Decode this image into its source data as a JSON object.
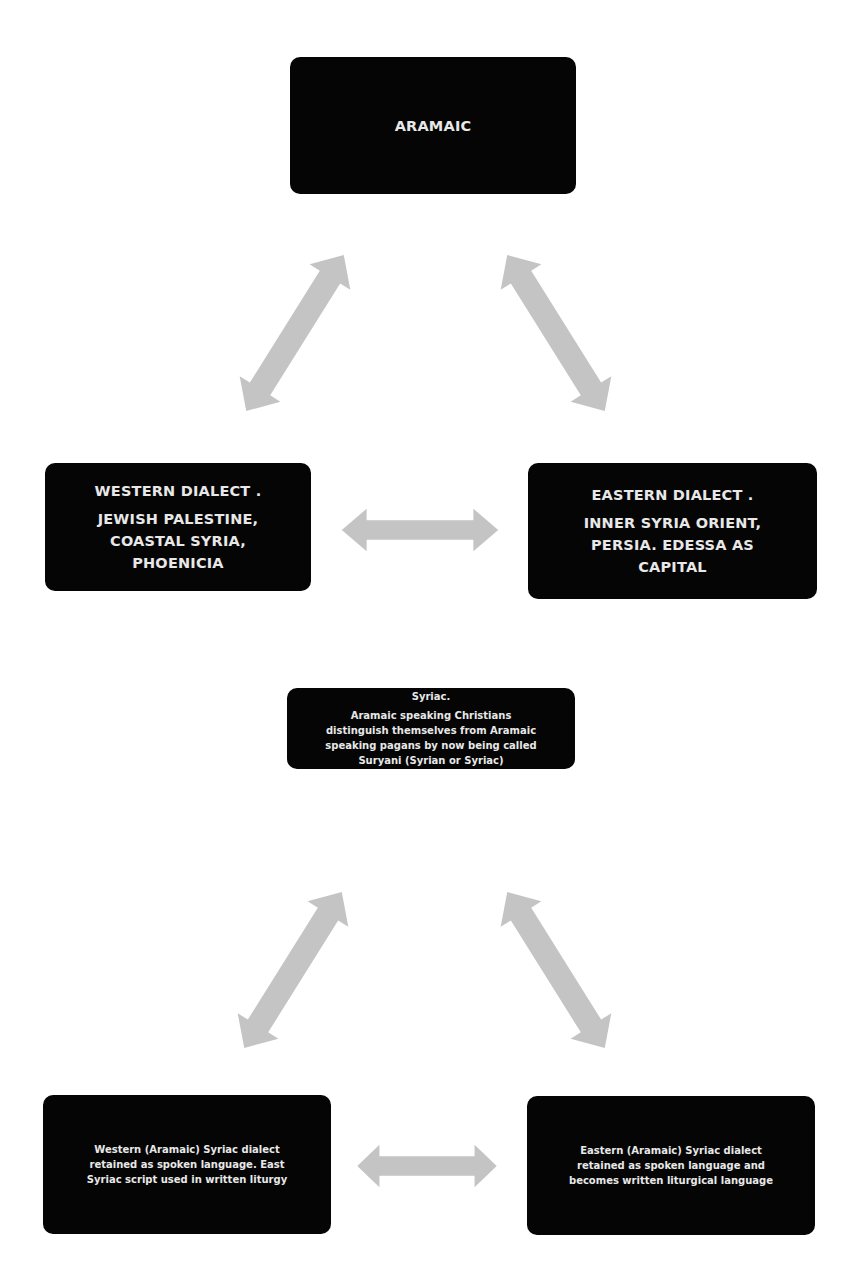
{
  "diagram": {
    "type": "flow-diagram",
    "colors": {
      "box_fill": "#050505",
      "box_text": "#e8e8e8",
      "arrow_fill": "#c4c4c4",
      "background": "#ffffff"
    },
    "nodes": {
      "aramaic": {
        "lines": [
          "ARAMAIC"
        ]
      },
      "western_dialect": {
        "heading": "WESTERN DIALECT .",
        "lines": [
          "JEWISH PALESTINE,",
          "COASTAL SYRIA,",
          "PHOENICIA"
        ]
      },
      "eastern_dialect": {
        "heading": "EASTERN DIALECT .",
        "lines": [
          "INNER SYRIA ORIENT,",
          "PERSIA. EDESSA AS",
          "CAPITAL"
        ]
      },
      "syriac": {
        "heading": "Syriac.",
        "lines": [
          "Aramaic speaking Christians",
          "distinguish themselves from Aramaic",
          "speaking pagans by now being called",
          "Suryani (Syrian or Syriac)"
        ]
      },
      "western_syriac": {
        "lines": [
          "Western (Aramaic) Syriac  dialect",
          "retained as spoken language. East",
          "Syriac script used in written liturgy"
        ]
      },
      "eastern_syriac": {
        "lines": [
          "Eastern (Aramaic) Syriac  dialect",
          "retained as spoken language and",
          "becomes written liturgical language"
        ]
      }
    },
    "edges": [
      {
        "from": "aramaic",
        "to": "western_dialect",
        "style": "double-arrow"
      },
      {
        "from": "aramaic",
        "to": "eastern_dialect",
        "style": "double-arrow"
      },
      {
        "from": "western_dialect",
        "to": "eastern_dialect",
        "style": "double-arrow"
      },
      {
        "from": "syriac",
        "to": "western_syriac",
        "style": "double-arrow"
      },
      {
        "from": "syriac",
        "to": "eastern_syriac",
        "style": "double-arrow"
      },
      {
        "from": "western_syriac",
        "to": "eastern_syriac",
        "style": "double-arrow"
      }
    ]
  }
}
